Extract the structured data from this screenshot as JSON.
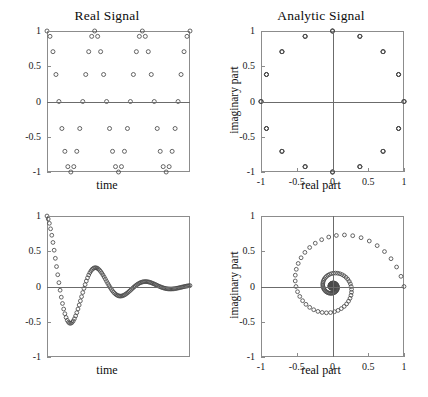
{
  "figure": {
    "width": 428,
    "height": 397,
    "background": "#ffffff",
    "marker_color": "#4a4a4a",
    "axis_color": "#8c8c8c"
  },
  "panels": [
    {
      "id": "real-signal-cosine",
      "title": "Real Signal",
      "xlabel": "time",
      "ylabel": "",
      "ytick_labels": [
        "1",
        "0.5",
        "0",
        "-0.5",
        "-1"
      ],
      "xtick_labels": []
    },
    {
      "id": "analytic-signal-circle",
      "title": "Analytic Signal",
      "xlabel": "real part",
      "ylabel": "imaginary part",
      "ytick_labels": [
        "1",
        "0.5",
        "0",
        "-0.5",
        "-1"
      ],
      "xtick_labels": [
        "-1",
        "-0.5",
        "0",
        "0.5",
        "1"
      ]
    },
    {
      "id": "real-signal-damped",
      "title": "",
      "xlabel": "time",
      "ylabel": "",
      "ytick_labels": [
        "1",
        "0.5",
        "0",
        "-0.5",
        "-1"
      ],
      "xtick_labels": []
    },
    {
      "id": "analytic-signal-spiral",
      "title": "",
      "xlabel": "real part",
      "ylabel": "imaginary part",
      "ytick_labels": [
        "1",
        "0.5",
        "0",
        "-0.5",
        "-1"
      ],
      "xtick_labels": [
        "-1",
        "-0.5",
        "0",
        "0.5",
        "1"
      ]
    }
  ],
  "chart_data": [
    {
      "type": "scatter",
      "id": "real-signal-cosine",
      "title": "Real Signal",
      "xlabel": "time",
      "ylabel": "",
      "xlim": [
        0,
        48
      ],
      "ylim": [
        -1,
        1
      ],
      "yticks": [
        1,
        0.5,
        0,
        -0.5,
        -1
      ],
      "ytick_labels": [
        "1",
        "0.5",
        "0",
        "-0.5",
        "-1"
      ],
      "xticks": [],
      "xtick_labels": [],
      "grid": false,
      "legend": null,
      "description": "Sampled cosine, 3 periods, 16 samples per period",
      "n_points": 49,
      "samples_per_period": 16,
      "periods": 3,
      "x": [
        0,
        1,
        2,
        3,
        4,
        5,
        6,
        7,
        8,
        9,
        10,
        11,
        12,
        13,
        14,
        15,
        16,
        17,
        18,
        19,
        20,
        21,
        22,
        23,
        24,
        25,
        26,
        27,
        28,
        29,
        30,
        31,
        32,
        33,
        34,
        35,
        36,
        37,
        38,
        39,
        40,
        41,
        42,
        43,
        44,
        45,
        46,
        47,
        48
      ],
      "y": [
        1,
        0.924,
        0.707,
        0.383,
        0,
        -0.383,
        -0.707,
        -0.924,
        -1,
        -0.924,
        -0.707,
        -0.383,
        0,
        0.383,
        0.707,
        0.924,
        1,
        0.924,
        0.707,
        0.383,
        0,
        -0.383,
        -0.707,
        -0.924,
        -1,
        -0.924,
        -0.707,
        -0.383,
        0,
        0.383,
        0.707,
        0.924,
        1,
        0.924,
        0.707,
        0.383,
        0,
        -0.383,
        -0.707,
        -0.924,
        -1,
        -0.924,
        -0.707,
        -0.383,
        0,
        0.383,
        0.707,
        0.924,
        1
      ]
    },
    {
      "type": "scatter",
      "id": "analytic-signal-circle",
      "title": "Analytic Signal",
      "xlabel": "real part",
      "ylabel": "imaginary part",
      "xlim": [
        -1,
        1
      ],
      "ylim": [
        -1,
        1
      ],
      "xticks": [
        -1,
        -0.5,
        0,
        0.5,
        1
      ],
      "xtick_labels": [
        "-1",
        "-0.5",
        "0",
        "0.5",
        "1"
      ],
      "yticks": [
        1,
        0.5,
        0,
        -0.5,
        -1
      ],
      "ytick_labels": [
        "1",
        "0.5",
        "0",
        "-0.5",
        "-1"
      ],
      "grid": false,
      "legend": null,
      "description": "Unit circle traced by analytic signal of a pure cosine",
      "n_points": 48,
      "radius": 1,
      "x": [
        1,
        0.924,
        0.707,
        0.383,
        0,
        -0.383,
        -0.707,
        -0.924,
        -1,
        -0.924,
        -0.707,
        -0.383,
        0,
        0.383,
        0.707,
        0.924,
        1,
        0.924,
        0.707,
        0.383,
        0,
        -0.383,
        -0.707,
        -0.924,
        -1,
        -0.924,
        -0.707,
        -0.383,
        0,
        0.383,
        0.707,
        0.924,
        1,
        0.924,
        0.707,
        0.383,
        0,
        -0.383,
        -0.707,
        -0.924,
        -1,
        -0.924,
        -0.707,
        -0.383,
        0,
        0.383,
        0.707,
        0.924
      ],
      "y": [
        0,
        0.383,
        0.707,
        0.924,
        1,
        0.924,
        0.707,
        0.383,
        0,
        -0.383,
        -0.707,
        -0.924,
        -1,
        -0.924,
        -0.707,
        -0.383,
        0,
        0.383,
        0.707,
        0.924,
        1,
        0.924,
        0.707,
        0.383,
        0,
        -0.383,
        -0.707,
        -0.924,
        -1,
        -0.924,
        -0.707,
        -0.383,
        0,
        0.383,
        0.707,
        0.924,
        1,
        0.924,
        0.707,
        0.383,
        0,
        -0.383,
        -0.707,
        -0.924,
        -1,
        -0.924,
        -0.707,
        -0.383
      ]
    },
    {
      "type": "scatter",
      "id": "real-signal-damped",
      "title": "",
      "xlabel": "time",
      "ylabel": "",
      "xlim": [
        0,
        120
      ],
      "ylim": [
        -1,
        1
      ],
      "yticks": [
        1,
        0.5,
        0,
        -0.5,
        -1
      ],
      "ytick_labels": [
        "1",
        "0.5",
        "0",
        "-0.5",
        "-1"
      ],
      "xticks": [],
      "xtick_labels": [],
      "grid": false,
      "legend": null,
      "description": "Exponentially damped cosine decaying toward zero",
      "n_points": 121,
      "decay_rate": 0.032,
      "samples_per_period": 42,
      "peak_values": [
        1,
        -0.68,
        0.21,
        -0.05
      ],
      "formula": "exp(-0.032 t) * cos(2 pi t / 42)"
    },
    {
      "type": "scatter",
      "id": "analytic-signal-spiral",
      "title": "",
      "xlabel": "real part",
      "ylabel": "imaginary part",
      "xlim": [
        -1,
        1
      ],
      "ylim": [
        -1,
        1
      ],
      "xticks": [
        -1,
        -0.5,
        0,
        0.5,
        1
      ],
      "xtick_labels": [
        "-1",
        "-0.5",
        "0",
        "0.5",
        "1"
      ],
      "yticks": [
        1,
        0.5,
        0,
        -0.5,
        -1
      ],
      "ytick_labels": [
        "1",
        "0.5",
        "0",
        "-0.5",
        "-1"
      ],
      "grid": false,
      "legend": null,
      "description": "Logarithmic spiral converging to the origin; analytic signal of the damped cosine",
      "n_points": 121,
      "decay_rate": 0.032,
      "samples_per_period": 42,
      "start_point": [
        1,
        0
      ],
      "end_point": [
        0,
        0
      ]
    }
  ]
}
